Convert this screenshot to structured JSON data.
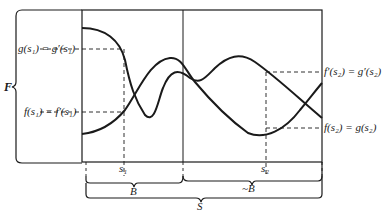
{
  "diagram": {
    "set_label": "F",
    "left_labels": {
      "upper": "g(s₁) = g′(s₁)",
      "lower": "f(s₁) = f′(s₁)"
    },
    "right_labels": {
      "upper": "f′(s₂) = g′(s₂)",
      "lower": "f(s₂) = g(s₂)"
    },
    "axis_points": {
      "s1": "s₁",
      "s2": "s₂"
    },
    "braces": {
      "B": "B",
      "not_B": "~B",
      "S": "S"
    },
    "colors": {
      "ink": "#1a1a1a",
      "background": "#ffffff"
    }
  }
}
